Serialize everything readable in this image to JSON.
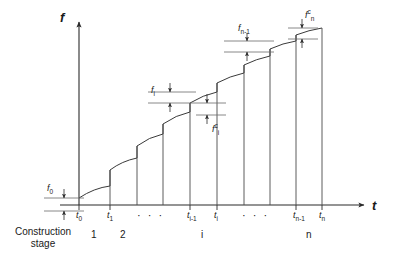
{
  "figure": {
    "type": "line",
    "axes": {
      "y_label": "f",
      "x_label": "t",
      "origin_x": 79,
      "origin_y": 205,
      "y_top": 18,
      "x_right": 368
    },
    "x_ticks": [
      {
        "key": "t0",
        "base": "t",
        "sub": "0",
        "x": 79
      },
      {
        "key": "t1",
        "base": "t",
        "sub": "1",
        "x": 110
      },
      {
        "key": "dots1",
        "base": "· · ·",
        "sub": "",
        "x": 148
      },
      {
        "key": "tim1",
        "base": "t",
        "sub": "i-1",
        "x": 190
      },
      {
        "key": "ti",
        "base": "t",
        "sub": "i",
        "x": 217
      },
      {
        "key": "dots2",
        "base": "· · ·",
        "sub": "",
        "x": 253
      },
      {
        "key": "tnm1",
        "base": "t",
        "sub": "n-1",
        "x": 296
      },
      {
        "key": "tn",
        "base": "t",
        "sub": "n",
        "x": 322
      }
    ],
    "stage_numbers": [
      {
        "label": "1",
        "x": 94
      },
      {
        "label": "2",
        "x": 123
      },
      {
        "label": "i",
        "x": 204
      },
      {
        "label": "n",
        "x": 309
      }
    ],
    "construction_stage_label_line1": "Construction",
    "construction_stage_label_line2": "stage",
    "dimension_labels": [
      {
        "key": "f0",
        "base": "f",
        "sub": "0",
        "sup": "",
        "x": 47,
        "y": 184
      },
      {
        "key": "fi",
        "base": "f",
        "sub": "i",
        "sup": "",
        "x": 151,
        "y": 86
      },
      {
        "key": "fic",
        "base": "f",
        "sub": "i",
        "sup": "c",
        "x": 212,
        "y": 123
      },
      {
        "key": "fnm1",
        "base": "f",
        "sub": "n-1",
        "sup": "",
        "x": 238,
        "y": 24
      },
      {
        "key": "fnc",
        "base": "f",
        "sub": "n",
        "sup": "c",
        "x": 305,
        "y": 9
      }
    ],
    "steps": [
      {
        "index": 0,
        "x_start": 79,
        "x_end": 110,
        "y_start": 198,
        "y_end": 186
      },
      {
        "index": 1,
        "x_start": 110,
        "x_end": 137,
        "y_start": 170,
        "y_end": 158
      },
      {
        "index": 2,
        "x_start": 137,
        "x_end": 163,
        "y_start": 146,
        "y_end": 134
      },
      {
        "index": 3,
        "x_start": 163,
        "x_end": 190,
        "y_start": 124,
        "y_end": 112
      },
      {
        "index": 4,
        "x_start": 190,
        "x_end": 217,
        "y_start": 103,
        "y_end": 92
      },
      {
        "index": 5,
        "x_start": 217,
        "x_end": 244,
        "y_start": 83,
        "y_end": 73
      },
      {
        "index": 6,
        "x_start": 244,
        "x_end": 270,
        "y_start": 65,
        "y_end": 56
      },
      {
        "index": 7,
        "x_start": 270,
        "x_end": 296,
        "y_start": 49,
        "y_end": 41
      },
      {
        "index": 8,
        "x_start": 296,
        "x_end": 322,
        "y_start": 35,
        "y_end": 28
      }
    ],
    "colors": {
      "line": "#2b2b2b",
      "thin": "#6a6a6a",
      "text": "#1a1a1a"
    }
  }
}
